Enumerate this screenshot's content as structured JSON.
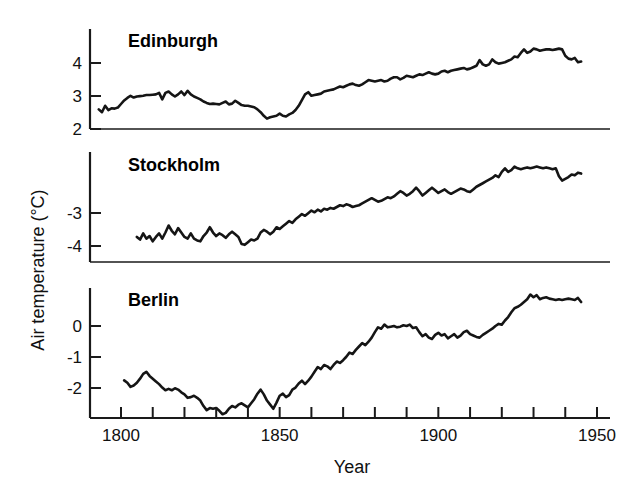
{
  "chart_data": {
    "type": "line",
    "title": "",
    "xlabel": "Year",
    "ylabel": "Air temperature (°C)",
    "xlim": [
      1793,
      1950
    ],
    "xticks_major": [
      1800,
      1850,
      1900,
      1950
    ],
    "xticks_major_labels": [
      "1800",
      "1850",
      "1900",
      "1950"
    ],
    "xtick_step_minor": 10,
    "grid": false,
    "legend": "none",
    "panels": [
      {
        "name": "Edinburgh",
        "ylabel_ticks": [
          "2",
          "3",
          "4"
        ],
        "ytick_values": [
          2,
          3,
          4
        ],
        "ylim": [
          1.75,
          4.55
        ],
        "x_start": 1793,
        "x_end": 1945,
        "values": [
          2.3,
          2.22,
          2.4,
          2.28,
          2.33,
          2.32,
          2.35,
          2.45,
          2.55,
          2.62,
          2.68,
          2.63,
          2.66,
          2.67,
          2.68,
          2.7,
          2.7,
          2.71,
          2.72,
          2.76,
          2.58,
          2.76,
          2.8,
          2.72,
          2.66,
          2.72,
          2.8,
          2.7,
          2.82,
          2.72,
          2.66,
          2.62,
          2.58,
          2.52,
          2.48,
          2.45,
          2.46,
          2.45,
          2.44,
          2.48,
          2.52,
          2.44,
          2.46,
          2.54,
          2.48,
          2.42,
          2.4,
          2.4,
          2.38,
          2.36,
          2.3,
          2.22,
          2.12,
          2.04,
          2.08,
          2.1,
          2.12,
          2.18,
          2.12,
          2.1,
          2.16,
          2.2,
          2.28,
          2.4,
          2.56,
          2.72,
          2.78,
          2.68,
          2.7,
          2.72,
          2.74,
          2.8,
          2.82,
          2.84,
          2.86,
          2.9,
          2.94,
          2.92,
          2.96,
          3.0,
          3.02,
          2.98,
          2.96,
          3.0,
          3.06,
          3.12,
          3.1,
          3.08,
          3.1,
          3.12,
          3.08,
          3.1,
          3.16,
          3.2,
          3.2,
          3.14,
          3.18,
          3.24,
          3.22,
          3.2,
          3.24,
          3.28,
          3.26,
          3.3,
          3.34,
          3.3,
          3.28,
          3.3,
          3.36,
          3.38,
          3.34,
          3.38,
          3.4,
          3.42,
          3.44,
          3.46,
          3.42,
          3.44,
          3.48,
          3.52,
          3.68,
          3.56,
          3.52,
          3.56,
          3.7,
          3.62,
          3.58,
          3.6,
          3.62,
          3.66,
          3.7,
          3.78,
          3.76,
          3.88,
          3.98,
          3.88,
          3.92,
          4.0,
          3.98,
          3.94,
          3.96,
          3.98,
          3.98,
          3.96,
          3.98,
          4.0,
          3.98,
          3.8,
          3.72,
          3.7,
          3.74,
          3.62,
          3.64
        ]
      },
      {
        "name": "Stockholm",
        "ylabel_ticks": [
          "-4",
          "-3"
        ],
        "ytick_values": [
          -4,
          -3
        ],
        "ylim": [
          -4.75,
          -2.25
        ],
        "x_start": 1805,
        "x_end": 1945,
        "values": [
          -4.18,
          -4.24,
          -4.1,
          -4.22,
          -4.16,
          -4.28,
          -4.18,
          -4.1,
          -4.22,
          -4.08,
          -3.92,
          -4.04,
          -4.12,
          -3.98,
          -4.08,
          -4.18,
          -4.22,
          -4.1,
          -4.22,
          -4.26,
          -4.28,
          -4.16,
          -4.08,
          -3.96,
          -4.08,
          -4.16,
          -4.1,
          -4.14,
          -4.2,
          -4.12,
          -4.06,
          -4.12,
          -4.18,
          -4.34,
          -4.36,
          -4.3,
          -4.24,
          -4.26,
          -4.22,
          -4.08,
          -4.02,
          -4.06,
          -4.12,
          -4.06,
          -3.96,
          -4.0,
          -3.94,
          -3.88,
          -3.82,
          -3.86,
          -3.78,
          -3.72,
          -3.66,
          -3.7,
          -3.64,
          -3.58,
          -3.62,
          -3.56,
          -3.6,
          -3.54,
          -3.56,
          -3.52,
          -3.54,
          -3.5,
          -3.46,
          -3.48,
          -3.44,
          -3.46,
          -3.5,
          -3.48,
          -3.46,
          -3.42,
          -3.38,
          -3.34,
          -3.3,
          -3.34,
          -3.38,
          -3.36,
          -3.32,
          -3.28,
          -3.3,
          -3.26,
          -3.2,
          -3.14,
          -3.18,
          -3.24,
          -3.2,
          -3.14,
          -3.06,
          -3.14,
          -3.24,
          -3.18,
          -3.12,
          -3.06,
          -3.12,
          -3.18,
          -3.14,
          -3.1,
          -3.16,
          -3.2,
          -3.16,
          -3.12,
          -3.08,
          -3.1,
          -3.14,
          -3.16,
          -3.1,
          -3.04,
          -3.0,
          -2.96,
          -2.92,
          -2.88,
          -2.84,
          -2.78,
          -2.82,
          -2.7,
          -2.62,
          -2.7,
          -2.66,
          -2.58,
          -2.62,
          -2.64,
          -2.62,
          -2.6,
          -2.62,
          -2.6,
          -2.58,
          -2.6,
          -2.62,
          -2.6,
          -2.62,
          -2.64,
          -2.62,
          -2.8,
          -2.9,
          -2.86,
          -2.82,
          -2.76,
          -2.78,
          -2.72,
          -2.74
        ]
      },
      {
        "name": "Berlin",
        "ylabel_ticks": [
          "-2",
          "-1",
          "0"
        ],
        "ytick_values": [
          -2,
          -1,
          0
        ],
        "ylim": [
          -2.95,
          0.85
        ],
        "x_start": 1801,
        "x_end": 1945,
        "values": [
          -1.85,
          -1.92,
          -2.04,
          -2.0,
          -1.92,
          -1.8,
          -1.66,
          -1.6,
          -1.72,
          -1.8,
          -1.88,
          -1.96,
          -2.06,
          -2.14,
          -2.1,
          -2.14,
          -2.08,
          -2.12,
          -2.2,
          -2.26,
          -2.36,
          -2.34,
          -2.3,
          -2.36,
          -2.44,
          -2.6,
          -2.72,
          -2.66,
          -2.68,
          -2.66,
          -2.74,
          -2.84,
          -2.8,
          -2.68,
          -2.6,
          -2.64,
          -2.56,
          -2.52,
          -2.58,
          -2.64,
          -2.52,
          -2.4,
          -2.24,
          -2.12,
          -2.26,
          -2.44,
          -2.56,
          -2.68,
          -2.5,
          -2.3,
          -2.24,
          -2.34,
          -2.28,
          -2.12,
          -2.06,
          -1.94,
          -1.86,
          -1.96,
          -1.86,
          -1.74,
          -1.6,
          -1.46,
          -1.52,
          -1.4,
          -1.44,
          -1.52,
          -1.4,
          -1.3,
          -1.34,
          -1.26,
          -1.16,
          -1.04,
          -1.08,
          -0.96,
          -0.86,
          -0.76,
          -0.82,
          -0.72,
          -0.6,
          -0.44,
          -0.3,
          -0.34,
          -0.22,
          -0.3,
          -0.28,
          -0.26,
          -0.3,
          -0.28,
          -0.24,
          -0.26,
          -0.22,
          -0.32,
          -0.3,
          -0.44,
          -0.56,
          -0.5,
          -0.6,
          -0.64,
          -0.52,
          -0.46,
          -0.54,
          -0.5,
          -0.62,
          -0.56,
          -0.5,
          -0.6,
          -0.54,
          -0.44,
          -0.4,
          -0.5,
          -0.54,
          -0.58,
          -0.6,
          -0.52,
          -0.46,
          -0.4,
          -0.34,
          -0.26,
          -0.2,
          -0.22,
          -0.1,
          0.0,
          0.14,
          0.26,
          0.3,
          0.36,
          0.44,
          0.52,
          0.66,
          0.58,
          0.64,
          0.52,
          0.56,
          0.58,
          0.54,
          0.52,
          0.5,
          0.52,
          0.5,
          0.52,
          0.54,
          0.52,
          0.5,
          0.56,
          0.44
        ]
      }
    ]
  }
}
